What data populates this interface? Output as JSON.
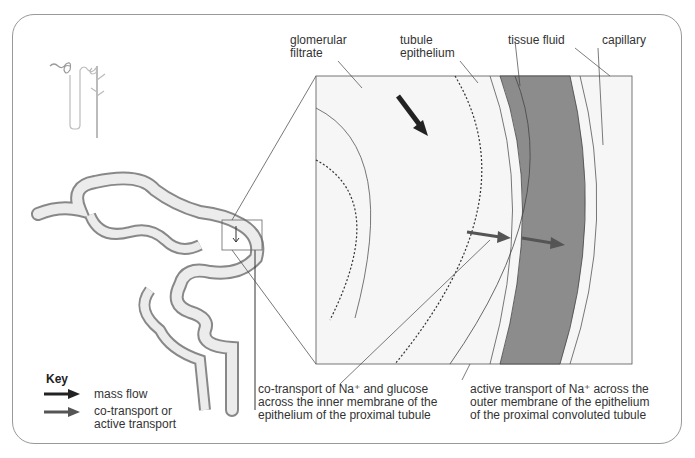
{
  "labels": {
    "glomerular_filtrate": [
      "glomerular",
      "filtrate"
    ],
    "tubule_epithelium": [
      "tubule",
      "epithelium"
    ],
    "tissue_fluid": "tissue fluid",
    "capillary": "capillary"
  },
  "captions": {
    "cotransport": [
      "co-transport of Na⁺ and glucose",
      "across the inner membrane of the",
      "epithelium of the proximal tubule"
    ],
    "active": [
      "active transport of Na⁺ across the",
      "outer membrane of the epithelium",
      "of the proximal convoluted tubule"
    ]
  },
  "key": {
    "title": "Key",
    "items": [
      {
        "label": [
          "mass flow"
        ],
        "color": "#222222"
      },
      {
        "label": [
          "co-transport or",
          "active transport"
        ],
        "color": "#555555"
      }
    ]
  },
  "colors": {
    "capillary": "#8c8c8c",
    "tubule_fill": "#ececec",
    "vessel": "#888888"
  }
}
